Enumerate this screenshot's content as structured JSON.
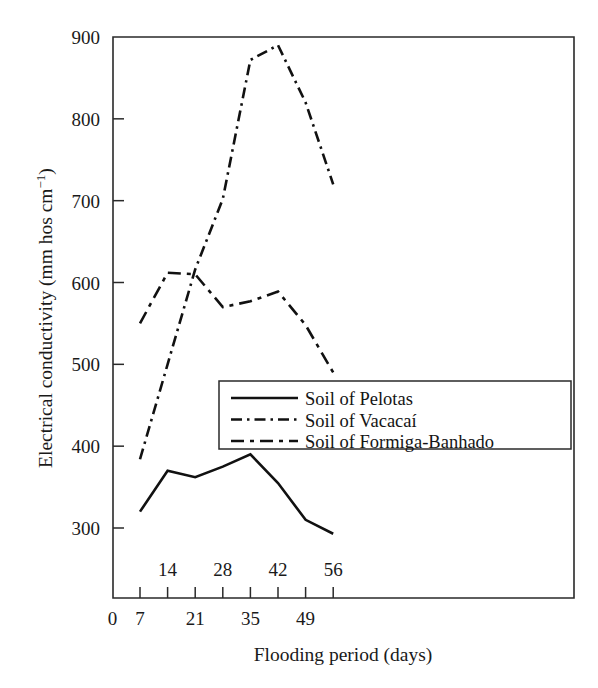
{
  "chart_data": {
    "type": "line",
    "title": "",
    "xlabel": "Flooding period (days)",
    "ylabel": "Electrical conductivity (mm hos cm⁻¹)",
    "x": [
      7,
      14,
      21,
      28,
      35,
      42,
      49,
      56
    ],
    "xlim": [
      0,
      63
    ],
    "ylim": [
      250,
      900
    ],
    "grid": false,
    "legend_position": "center-right-inside",
    "x_ticks_below": [
      "0",
      "7",
      "21",
      "35",
      "49"
    ],
    "x_tick_values_below": [
      0,
      7,
      21,
      35,
      49
    ],
    "x_ticks_above": [
      "14",
      "28",
      "42",
      "56"
    ],
    "x_tick_values_above": [
      14,
      28,
      42,
      56
    ],
    "y_ticks": [
      "300",
      "400",
      "500",
      "600",
      "700",
      "800",
      "900"
    ],
    "y_tick_values": [
      300,
      400,
      500,
      600,
      700,
      800,
      900
    ],
    "series": [
      {
        "name": "Soil of Pelotas",
        "style": "solid",
        "values": [
          320,
          370,
          362,
          375,
          390,
          355,
          310,
          293
        ]
      },
      {
        "name": "Soil of Vacacaí",
        "style": "dash-dot",
        "values": [
          384,
          500,
          616,
          702,
          872,
          890,
          820,
          720
        ]
      },
      {
        "name": "Soil of Formiga-Banhado",
        "style": "dashed",
        "values": [
          550,
          612,
          610,
          570,
          577,
          589,
          548,
          490
        ]
      }
    ]
  },
  "legend": {
    "items": [
      {
        "label": "Soil of Pelotas",
        "style": "solid"
      },
      {
        "label": "Soil of Vacacaí",
        "style": "dash-dot"
      },
      {
        "label": "Soil of Formiga-Banhado",
        "style": "dashed"
      }
    ]
  },
  "axes": {
    "y_title": "Electrical conductivity (mm hos cm⁻¹)",
    "y_title_main": "Electrical conductivity (mm hos cm",
    "y_title_sup": "−1",
    "y_title_tail": ")",
    "x_title": "Flooding period (days)"
  },
  "colors": {
    "line": "#111111",
    "axis": "#2a2a2a",
    "background": "#ffffff",
    "text": "#1a1a1a"
  }
}
